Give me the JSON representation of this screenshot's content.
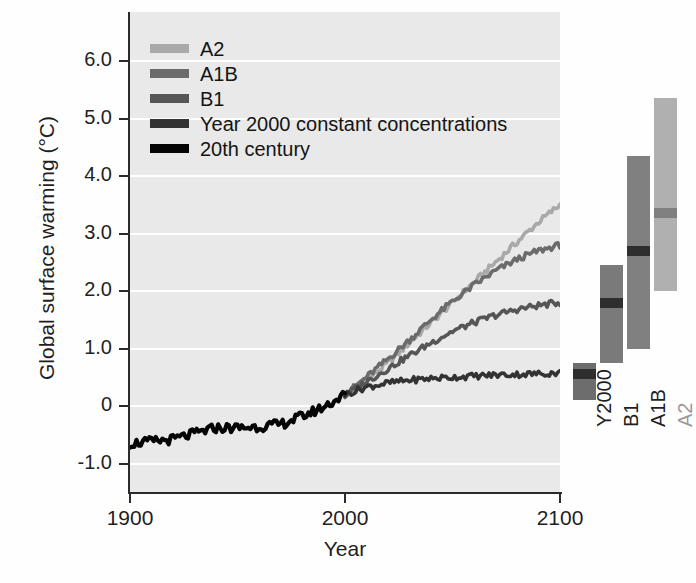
{
  "figure": {
    "title": "",
    "background_color": "#e9e9e9",
    "gridline_color": "#ffffff"
  },
  "chart_data": {
    "type": "line",
    "title": "",
    "subtitle": "",
    "xlabel": "Year",
    "ylabel": "Global surface warming (°C)",
    "xlim": [
      1900,
      2100
    ],
    "ylim": [
      -1.0,
      6.5
    ],
    "xticks": [
      1900,
      2000,
      2100
    ],
    "xtick_labels": [
      "1900",
      "2000",
      "2100"
    ],
    "yticks": [
      -1.0,
      0,
      1.0,
      2.0,
      3.0,
      4.0,
      5.0,
      6.0
    ],
    "ytick_labels": [
      "-1.0",
      "0",
      "1.0",
      "2.0",
      "3.0",
      "4.0",
      "5.0",
      "6.0"
    ],
    "grid": true,
    "grid_axis": "y",
    "legend_position": "top-left",
    "series": [
      {
        "name": "A2",
        "color": "#a9a9a9",
        "x": [
          2000,
          2010,
          2020,
          2030,
          2040,
          2050,
          2060,
          2070,
          2080,
          2090,
          2100
        ],
        "values": [
          0.2,
          0.45,
          0.75,
          1.1,
          1.45,
          1.8,
          2.15,
          2.5,
          2.85,
          3.2,
          3.5
        ]
      },
      {
        "name": "A1B",
        "color": "#6b6b6b",
        "x": [
          2000,
          2010,
          2020,
          2030,
          2040,
          2050,
          2060,
          2070,
          2080,
          2090,
          2100
        ],
        "values": [
          0.2,
          0.5,
          0.82,
          1.15,
          1.5,
          1.82,
          2.1,
          2.35,
          2.55,
          2.7,
          2.8
        ]
      },
      {
        "name": "B1",
        "color": "#565656",
        "x": [
          2000,
          2010,
          2020,
          2030,
          2040,
          2050,
          2060,
          2070,
          2080,
          2090,
          2100
        ],
        "values": [
          0.2,
          0.42,
          0.65,
          0.88,
          1.1,
          1.3,
          1.45,
          1.58,
          1.68,
          1.75,
          1.8
        ]
      },
      {
        "name": "Year 2000 constant concentrations",
        "color": "#333333",
        "x": [
          2000,
          2010,
          2020,
          2030,
          2040,
          2050,
          2060,
          2070,
          2080,
          2090,
          2100
        ],
        "values": [
          0.2,
          0.33,
          0.4,
          0.45,
          0.48,
          0.5,
          0.52,
          0.54,
          0.55,
          0.56,
          0.58
        ]
      },
      {
        "name": "20th century",
        "color": "#050505",
        "x": [
          1900,
          1910,
          1920,
          1930,
          1940,
          1950,
          1960,
          1970,
          1980,
          1990,
          2000
        ],
        "values": [
          -0.65,
          -0.62,
          -0.58,
          -0.48,
          -0.38,
          -0.38,
          -0.36,
          -0.32,
          -0.18,
          -0.02,
          0.2
        ]
      }
    ],
    "range_bars": {
      "description": "Projected likely range and best estimate of global surface warming at 2090-2099 relative to 1980-1999",
      "unit": "°C",
      "bars": [
        {
          "label": "Y2000",
          "color": "#6d6d6d",
          "low": 0.1,
          "high": 0.75,
          "best": 0.55,
          "best_color": "#2e2e2e"
        },
        {
          "label": "B1",
          "color": "#7a7a7a",
          "low": 0.75,
          "high": 2.45,
          "best": 1.8,
          "best_color": "#2e2e2e"
        },
        {
          "label": "A1B",
          "color": "#808080",
          "low": 1.0,
          "high": 4.35,
          "best": 2.7,
          "best_color": "#2e2e2e"
        },
        {
          "label": "A2",
          "color": "#b0b0b0",
          "low": 2.0,
          "high": 5.35,
          "best": 3.35,
          "best_color": "#808080"
        }
      ]
    }
  },
  "legend": {
    "items": [
      {
        "label": "A2",
        "color": "#a9a9a9"
      },
      {
        "label": "A1B",
        "color": "#6b6b6b"
      },
      {
        "label": "B1",
        "color": "#565656"
      },
      {
        "label": "Year 2000 constant concentrations",
        "color": "#333333"
      },
      {
        "label": "20th century",
        "color": "#050505"
      }
    ]
  },
  "axes": {
    "y_title": "Global surface warming (°C)",
    "x_title": "Year"
  }
}
